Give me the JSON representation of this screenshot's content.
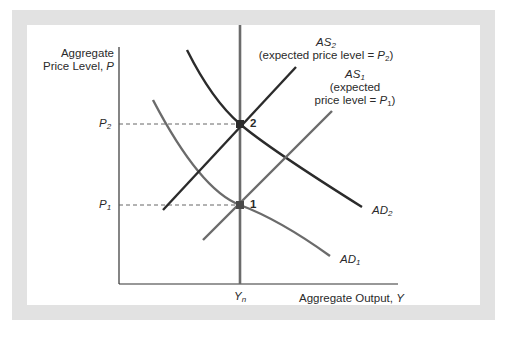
{
  "figure": {
    "y_axis_label_line1": "Aggregate",
    "y_axis_label_line2": "Price Level, ",
    "y_axis_var": "P",
    "x_axis_label": "Aggregate Output, ",
    "x_axis_var": "Y",
    "p2_label": "P",
    "p2_sub": "2",
    "p1_label": "P",
    "p1_sub": "1",
    "yn_label": "Y",
    "yn_sub": "n",
    "point_1": "1",
    "point_2": "2",
    "as2": {
      "name": "AS",
      "sub": "2",
      "desc_pre": "(expected price level = ",
      "desc_var": "P",
      "desc_sub": "2",
      "desc_post": ")"
    },
    "as1": {
      "name": "AS",
      "sub": "1",
      "desc_line1": "(expected",
      "desc_pre": "price level = ",
      "desc_var": "P",
      "desc_sub": "1",
      "desc_post": ")"
    },
    "ad2": {
      "name": "AD",
      "sub": "2"
    },
    "ad1": {
      "name": "AD",
      "sub": "1"
    },
    "colors": {
      "frame": "#e2e2e2",
      "axis": "#333333",
      "as2_ad2": "#2b2b2b",
      "as1_ad1_yn": "#6b6b6b",
      "dashed": "#555555"
    }
  }
}
